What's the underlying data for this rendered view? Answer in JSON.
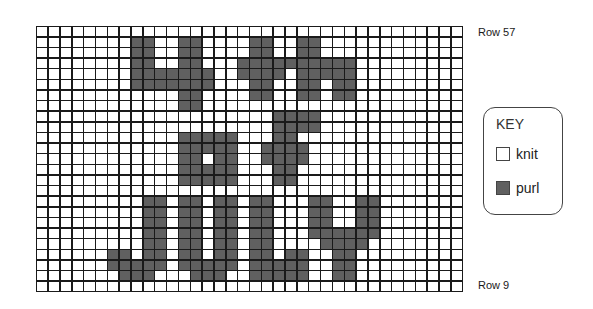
{
  "chart": {
    "columns": 36,
    "rows": 25,
    "top_row_label": "Row 57",
    "bottom_row_label": "Row 9",
    "pattern_text": "4th of JULY",
    "purl_cells_by_row": [
      [],
      [
        8,
        9,
        12,
        13,
        18,
        19,
        22,
        23
      ],
      [
        8,
        9,
        12,
        13,
        18,
        19,
        22,
        23
      ],
      [
        8,
        9,
        12,
        13,
        17,
        18,
        19,
        20,
        21,
        22,
        23,
        24,
        25,
        26
      ],
      [
        8,
        9,
        10,
        11,
        12,
        13,
        14,
        17,
        18,
        19,
        20,
        22,
        23,
        24,
        25,
        26
      ],
      [
        8,
        9,
        10,
        11,
        12,
        13,
        14,
        18,
        19,
        22,
        23,
        25,
        26
      ],
      [
        12,
        13,
        18,
        19,
        22,
        23,
        25,
        26
      ],
      [
        12,
        13
      ],
      [
        20,
        21,
        22,
        23
      ],
      [
        20,
        21,
        22,
        23
      ],
      [
        12,
        13,
        14,
        15,
        16,
        20,
        21
      ],
      [
        12,
        13,
        14,
        15,
        16,
        19,
        20,
        21,
        22
      ],
      [
        12,
        13,
        15,
        16,
        19,
        20,
        21,
        22
      ],
      [
        12,
        13,
        14,
        15,
        16,
        20,
        21
      ],
      [
        12,
        13,
        14,
        15,
        16,
        20,
        21
      ],
      [],
      [
        9,
        10,
        12,
        13,
        15,
        16,
        18,
        19,
        23,
        24,
        27,
        28
      ],
      [
        9,
        10,
        12,
        13,
        15,
        16,
        18,
        19,
        23,
        24,
        27,
        28
      ],
      [
        9,
        10,
        12,
        13,
        15,
        16,
        18,
        19,
        23,
        24,
        27,
        28
      ],
      [
        9,
        10,
        12,
        13,
        15,
        16,
        18,
        19,
        23,
        24,
        25,
        26,
        27,
        28
      ],
      [
        9,
        10,
        12,
        13,
        15,
        16,
        18,
        19,
        24,
        25,
        26,
        27
      ],
      [
        6,
        7,
        9,
        10,
        12,
        13,
        15,
        16,
        18,
        19,
        21,
        22,
        25,
        26
      ],
      [
        6,
        7,
        8,
        9,
        10,
        12,
        13,
        14,
        15,
        16,
        18,
        19,
        20,
        21,
        22,
        25,
        26
      ],
      [
        7,
        8,
        9,
        13,
        14,
        15,
        18,
        19,
        20,
        21,
        22,
        25,
        26
      ],
      []
    ],
    "colors": {
      "knit": "#ffffff",
      "purl": "#606060",
      "grid": "#1a1a1a"
    }
  },
  "key": {
    "title": "KEY",
    "items": [
      {
        "label": "knit",
        "stitch": "knit"
      },
      {
        "label": "purl",
        "stitch": "purl"
      }
    ]
  }
}
